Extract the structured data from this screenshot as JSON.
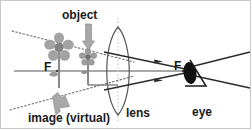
{
  "figure": {
    "background_color": "#ffffff",
    "width": 252,
    "height": 130,
    "labels": {
      "object": "object",
      "lens": "lens",
      "eye": "eye",
      "focal_point_left": "F",
      "focal_point_right": "F",
      "image": "image (virtual)"
    },
    "colors": {
      "ink": "#1a1a1a",
      "ray": "#333333",
      "axis": "#555555",
      "dotted_construction": "#666666",
      "flower_gray": "#9a9a9a",
      "flower_dark": "#6e6e6e",
      "stem_gray": "#8a8a8a",
      "arrow_gray": "#a0a0a0",
      "lens_outline": "#555555",
      "lens_axis_dotted": "#bdbdbd",
      "eye_fill": "#111111"
    },
    "elements": {
      "optical_axis": "horizontal-principal-axis",
      "lens_type": "biconvex-converging-lens",
      "object_marker": "small-flower",
      "image_marker": "large-flower-virtual",
      "eye_marker": "eye-with-triangle",
      "construction_lines": "dotted-virtual-image-rays",
      "ray_arrows": "refracted-rays-to-eye"
    }
  }
}
